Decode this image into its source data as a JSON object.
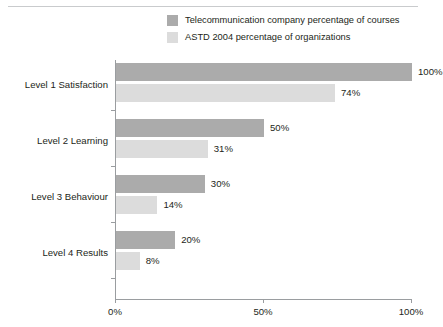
{
  "colors": {
    "series0": "#ababab",
    "series1": "#dcdcdc",
    "axis": "#9a9da0",
    "rule": "#c9cbcd",
    "text": "#231f20",
    "background": "#ffffff"
  },
  "legend": {
    "items": [
      {
        "label": "Telecommunication company percentage of courses",
        "color": "#ababab"
      },
      {
        "label": "ASTD 2004 percentage of organizations",
        "color": "#dcdcdc"
      }
    ]
  },
  "axis": {
    "x_ticks": [
      "0%",
      "50%",
      "100%"
    ],
    "x_tick_values": [
      0,
      50,
      100
    ]
  },
  "chart_data": {
    "type": "bar",
    "orientation": "horizontal",
    "title": "",
    "subtitle": "",
    "xlabel": "",
    "ylabel": "",
    "xlim": [
      0,
      100
    ],
    "grid": false,
    "legend_position": "top-right",
    "categories": [
      "Level 1 Satisfaction",
      "Level 2 Learning",
      "Level 3 Behaviour",
      "Level 4 Results"
    ],
    "series": [
      {
        "name": "Telecommunication company percentage of courses",
        "color": "#ababab",
        "values": [
          100,
          50,
          30,
          20
        ],
        "labels": [
          "100%",
          "50%",
          "30%",
          "20%"
        ]
      },
      {
        "name": "ASTD 2004 percentage of organizations",
        "color": "#dcdcdc",
        "values": [
          74,
          31,
          14,
          8
        ],
        "labels": [
          "74%",
          "31%",
          "14%",
          "8%"
        ]
      }
    ]
  }
}
